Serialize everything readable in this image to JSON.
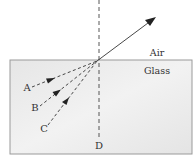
{
  "diagram": {
    "media": {
      "upper": "Air",
      "lower": "Glass"
    },
    "normal_label": "D",
    "rays": [
      {
        "label": "A",
        "type": "incident"
      },
      {
        "label": "B",
        "type": "incident"
      },
      {
        "label": "C",
        "type": "incident"
      }
    ],
    "refracted_ray": {
      "direction": "up-right into air"
    },
    "colors": {
      "glass_fill": "#ebebeb",
      "glass_border": "#9a9a9a",
      "line": "#333333"
    }
  }
}
